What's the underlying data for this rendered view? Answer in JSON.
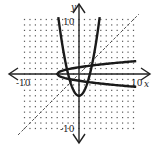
{
  "chart_data": {
    "type": "line",
    "title": "",
    "xlabel": "x",
    "ylabel": "y",
    "xlim": [
      -10,
      10
    ],
    "ylim": [
      -10,
      10
    ],
    "grid": "dotted points at integer coordinates",
    "tick_labels": {
      "x_min": "-10",
      "x_max": "10",
      "y_min": "-10",
      "y_max": "10"
    },
    "series": [
      {
        "name": "f(x) = x^2 - 4",
        "style": "solid thick",
        "equation": "y = x^2 - 4",
        "vertex": [
          0,
          -4
        ]
      },
      {
        "name": "inverse: x = y^2 - 4",
        "style": "solid thick",
        "equation": "x = y^2 - 4",
        "vertex": [
          -4,
          0
        ]
      },
      {
        "name": "y = x",
        "style": "dashed",
        "equation": "y = x"
      }
    ]
  },
  "labels": {
    "x_axis": "x",
    "y_axis": "y",
    "x_neg": "-10",
    "x_pos": "10",
    "y_pos": "10",
    "y_neg": "-10"
  },
  "colors": {
    "curve": "#1a1a1a",
    "axis": "#222222",
    "grid": "#555555",
    "dashed": "#444444"
  }
}
